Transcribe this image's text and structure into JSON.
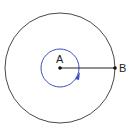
{
  "diagram": {
    "points": [
      {
        "id": "A",
        "label": "A",
        "role": "center"
      },
      {
        "id": "B",
        "label": "B",
        "role": "point on outer circle"
      }
    ],
    "outer_circle": {
      "color": "#333333",
      "description": "circle centered at A passing through B"
    },
    "inner_circle": {
      "color": "#3a4fc2",
      "description": "small circle around A with arrow indicating rotation direction (clockwise)"
    },
    "segment": {
      "from": "A",
      "to": "B",
      "color": "#222222"
    }
  }
}
